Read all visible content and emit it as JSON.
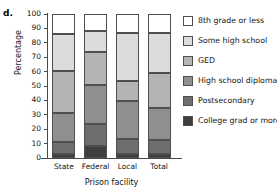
{
  "panel_label": "d.",
  "chart_data": {
    "type": "bar",
    "subtype": "stacked-bar-100-percent",
    "title": "",
    "xlabel": "Prison facility",
    "ylabel": "Percentage",
    "ylim": [
      0,
      100
    ],
    "yticks": [
      0,
      10,
      20,
      30,
      40,
      50,
      60,
      70,
      80,
      90,
      100
    ],
    "ytick_labels": [
      "0",
      "10",
      "20",
      "30",
      "40",
      "50",
      "60",
      "70",
      "80",
      "90",
      "100"
    ],
    "grid": false,
    "legend_position": "right",
    "categories": [
      "State",
      "Federal",
      "Local",
      "Total"
    ],
    "series": [
      {
        "name": "College grad or more",
        "color": "#3f3f3f",
        "values": [
          2.5,
          8.0,
          3.0,
          3.0
        ],
        "cumulative_top": [
          2.5,
          8.0,
          3.0,
          3.0
        ]
      },
      {
        "name": "Postsecondary",
        "color": "#6e6e6e",
        "values": [
          8.5,
          15.5,
          10.5,
          9.5
        ],
        "cumulative_top": [
          11.0,
          23.5,
          13.5,
          12.5
        ]
      },
      {
        "name": "High school diploma",
        "color": "#8f8f8f",
        "values": [
          20.5,
          27.5,
          26.0,
          22.0
        ],
        "cumulative_top": [
          31.5,
          51.0,
          39.5,
          34.5
        ]
      },
      {
        "name": "GED",
        "color": "#b4b4b4",
        "values": [
          29.0,
          22.5,
          14.0,
          24.5
        ],
        "cumulative_top": [
          60.5,
          73.5,
          53.5,
          59.0
        ]
      },
      {
        "name": "Some high school",
        "color": "#dcdcdc",
        "values": [
          25.5,
          14.5,
          33.5,
          28.0
        ],
        "cumulative_top": [
          86.0,
          88.0,
          87.0,
          87.0
        ]
      },
      {
        "name": "8th grade or less",
        "color": "#ffffff",
        "values": [
          14.0,
          12.0,
          13.0,
          13.0
        ],
        "cumulative_top": [
          100.0,
          100.0,
          100.0,
          100.0
        ]
      }
    ]
  },
  "legend": {
    "items": [
      {
        "label": "8th grade or less",
        "color": "#ffffff"
      },
      {
        "label": "Some high school",
        "color": "#dcdcdc"
      },
      {
        "label": "GED",
        "color": "#b4b4b4"
      },
      {
        "label": "High school diploma",
        "color": "#8f8f8f"
      },
      {
        "label": "Postsecondary",
        "color": "#6e6e6e"
      },
      {
        "label": "College grad or more",
        "color": "#3f3f3f"
      }
    ]
  }
}
